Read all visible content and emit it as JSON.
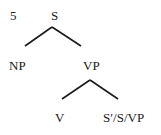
{
  "diagram": {
    "example_number": "5",
    "nodes": {
      "root": "S",
      "np": "NP",
      "vp": "VP",
      "v": "V",
      "complement": "S′/S/VP"
    },
    "edges": [
      [
        "S",
        "NP"
      ],
      [
        "S",
        "VP"
      ],
      [
        "VP",
        "V"
      ],
      [
        "VP",
        "S′/S/VP"
      ]
    ]
  }
}
